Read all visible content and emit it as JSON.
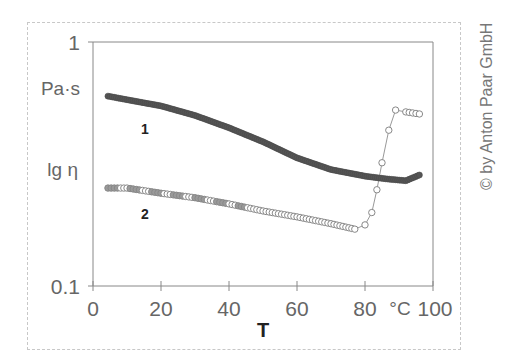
{
  "chart_data": {
    "type": "line",
    "title": "",
    "xlabel": "T",
    "x_unit": "°C",
    "ylabel": "lg η",
    "y_unit": "Pa·s",
    "yscale": "log",
    "xlim": [
      0,
      100
    ],
    "ylim": [
      0.1,
      1
    ],
    "x_ticks": [
      0,
      20,
      40,
      60,
      80,
      100
    ],
    "y_ticks": [
      0.1,
      1
    ],
    "grid": false,
    "legend": "inline labels",
    "series": [
      {
        "name": "1",
        "marker": "filled circle",
        "color": "#555555",
        "x": [
          4.4,
          10,
          20,
          30,
          40,
          50,
          60,
          70,
          80,
          86,
          92,
          96
        ],
        "values": [
          0.6,
          0.58,
          0.547,
          0.5,
          0.445,
          0.39,
          0.335,
          0.3,
          0.282,
          0.275,
          0.27,
          0.285
        ]
      },
      {
        "name": "2",
        "marker": "open circle",
        "color": "#888888",
        "x": [
          4.4,
          10,
          20,
          30,
          40,
          50,
          60,
          70,
          77,
          80,
          82,
          83.5,
          85,
          87,
          89,
          92,
          96
        ],
        "values": [
          0.252,
          0.252,
          0.24,
          0.23,
          0.217,
          0.203,
          0.192,
          0.18,
          0.171,
          0.178,
          0.2,
          0.248,
          0.32,
          0.435,
          0.526,
          0.517,
          0.507
        ]
      }
    ],
    "annotations": [
      "1",
      "2"
    ]
  },
  "labels": {
    "y_top": "1",
    "y_bottom": "0.1",
    "y_unit": "Pa·s",
    "y_title": "lg η",
    "x_ticks": [
      "0",
      "20",
      "40",
      "60",
      "80",
      "100"
    ],
    "x_unit": "°C",
    "x_title": "T",
    "series1": "1",
    "series2": "2",
    "copyright": "© by Anton Paar GmbH"
  }
}
